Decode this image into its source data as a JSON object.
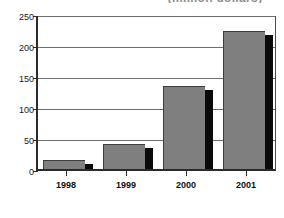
{
  "chart_data": {
    "type": "bar",
    "title": "(million dollars)",
    "title_note": "clipped at top edge of image",
    "xlabel": "",
    "ylabel": "",
    "categories": [
      "1998",
      "1999",
      "2000",
      "2001"
    ],
    "values": [
      15,
      40,
      134,
      222
    ],
    "series": [
      {
        "name": "Value",
        "values": [
          15,
          40,
          134,
          222
        ]
      }
    ],
    "ylim": [
      0,
      250
    ],
    "yticks": [
      0,
      50,
      100,
      150,
      200,
      250
    ],
    "ytick_labels": [
      "0",
      "50",
      "100",
      "150",
      "200",
      "250"
    ],
    "grid": true,
    "grid_axis": "y",
    "legend": false,
    "bar_color": "#7f7f7f",
    "bar_shadow_color": "#0a0a0a",
    "axis_color": "#2b2b2b",
    "grid_color": "#6e6e6e",
    "background": "#ffffff"
  }
}
